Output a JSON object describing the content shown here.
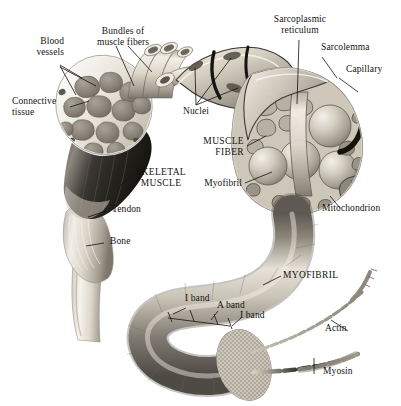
{
  "figure": {
    "background_color": "#ffffff",
    "ink_color": "#14120f",
    "width": 401,
    "height": 406
  },
  "labels": {
    "blood_vessels": "Blood\nvessels",
    "bundles_of_muscle_fibers": "Bundles of\nmuscle fibers",
    "connective_tissue": "Connective\ntissue",
    "skeletal_muscle": "SKELETAL\nMUSCLE",
    "tendon": "Tendon",
    "bone": "Bone",
    "nuclei": "Nuclei",
    "sarcoplasmic_reticulum": "Sarcoplasmic\nreticulum",
    "sarcolemma": "Sarcolemma",
    "capillary": "Capillary",
    "muscle_fiber": "MUSCLE\nFIBER",
    "myofibril_small": "Myofibril",
    "mitochondrion": "Mitochondrion",
    "myofibril_caps": "MYOFIBRIL",
    "i_band_left": "I band",
    "a_band": "A band",
    "i_band_right": "I band",
    "actin": "Actin",
    "myosin": "Myosin"
  },
  "structures": {
    "muscle_belly": "skeletal-muscle-belly",
    "fascicle_cross_section": "muscle-cross-section-fascicles",
    "fiber_bundle": "muscle-fiber-bundle",
    "muscle_fiber_cutaway": "muscle-fiber-cutaway",
    "myofibril_tube": "myofibril-tube",
    "actin_filament": "actin-filament",
    "myosin_filament": "myosin-filament",
    "tendon_structure": "tendon",
    "bone_structure": "bone"
  }
}
